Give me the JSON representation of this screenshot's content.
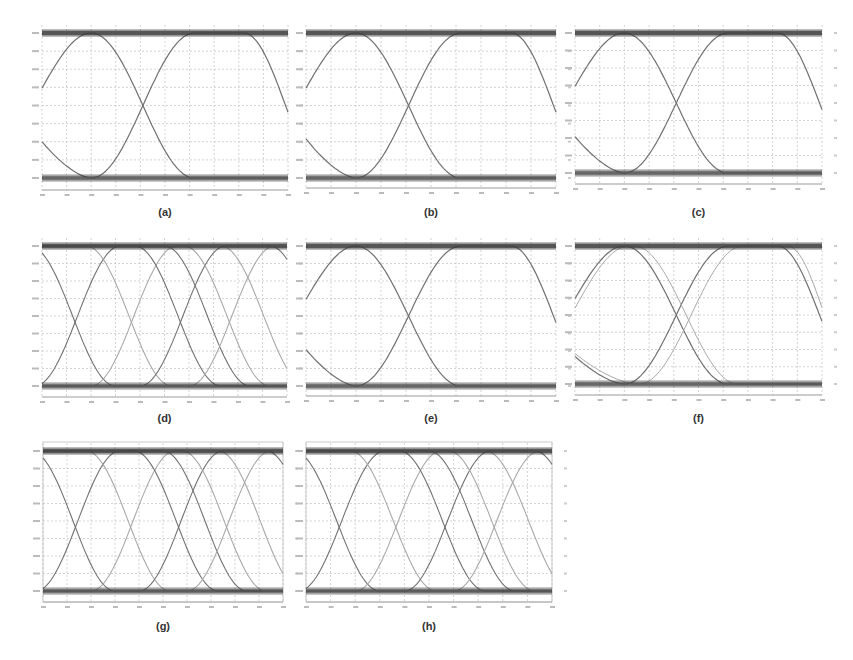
{
  "figure": {
    "panels": [
      {
        "id": "a",
        "label": "(a)",
        "box": [
          42,
          33,
          246,
          145
        ],
        "axis_y": 190,
        "caption_y": 206,
        "type": "eye2",
        "cross_x": 0.41,
        "left_start": 0.25,
        "variant": "plain"
      },
      {
        "id": "b",
        "label": "(b)",
        "box": [
          306,
          33,
          250,
          145
        ],
        "axis_y": 188,
        "caption_y": 206,
        "type": "eye2",
        "cross_x": 0.41,
        "left_start": 0.27,
        "variant": "plain"
      },
      {
        "id": "c",
        "label": "(c)",
        "box": [
          575,
          33,
          247,
          140
        ],
        "axis_y": 184,
        "caption_y": 206,
        "type": "eye2",
        "cross_x": 0.41,
        "left_start": 0.26,
        "variant": "plain"
      },
      {
        "id": "d",
        "label": "(d)",
        "box": [
          42,
          246,
          245,
          140
        ],
        "axis_y": 397,
        "caption_y": 412,
        "type": "eye3",
        "variant": "multi"
      },
      {
        "id": "e",
        "label": "(e)",
        "box": [
          306,
          246,
          250,
          140
        ],
        "axis_y": 396,
        "caption_y": 412,
        "type": "eye2",
        "cross_x": 0.41,
        "left_start": 0.26,
        "variant": "plain"
      },
      {
        "id": "f",
        "label": "(f)",
        "box": [
          575,
          246,
          247,
          138
        ],
        "axis_y": 395,
        "caption_y": 412,
        "type": "eye2",
        "cross_x": 0.37,
        "left_start": 0.2,
        "variant": "double"
      },
      {
        "id": "g",
        "label": "(g)",
        "box": [
          43,
          451,
          240,
          140
        ],
        "axis_y": 602,
        "caption_y": 620,
        "type": "eye3",
        "variant": "multi",
        "frame_top": 440
      },
      {
        "id": "h",
        "label": "(h)",
        "box": [
          306,
          451,
          246,
          140
        ],
        "axis_y": 602,
        "caption_y": 620,
        "type": "eye3",
        "variant": "multi",
        "frame_top": 440
      }
    ],
    "colors": {
      "rail": "#3a3a3a",
      "trace_dark": "#707070",
      "trace_light": "#a8a8a8",
      "grid": "#c8c8c8",
      "axis": "#9a9a9a",
      "caption": "#333333"
    }
  },
  "chart_data": [
    {
      "type": "line",
      "title": "(a)",
      "description": "Eye diagram, 2 bit periods, single crossing near 41% of span",
      "y_levels": [
        "high rail",
        "low rail"
      ],
      "grid": {
        "x_divisions": 10,
        "y_divisions": 8
      },
      "xlabel": "",
      "ylabel": ""
    },
    {
      "type": "line",
      "title": "(b)",
      "description": "Eye diagram, 2 bit periods",
      "grid": {
        "x_divisions": 10,
        "y_divisions": 8
      }
    },
    {
      "type": "line",
      "title": "(c)",
      "description": "Eye diagram, 2 bit periods",
      "grid": {
        "x_divisions": 10,
        "y_divisions": 8
      }
    },
    {
      "type": "line",
      "title": "(d)",
      "description": "Eye diagram, 3 transition sets, multiple overlaid traces",
      "grid": {
        "x_divisions": 10,
        "y_divisions": 8
      }
    },
    {
      "type": "line",
      "title": "(e)",
      "description": "Eye diagram, 2 bit periods",
      "grid": {
        "x_divisions": 10,
        "y_divisions": 8
      }
    },
    {
      "type": "line",
      "title": "(f)",
      "description": "Eye diagram, 2 bit periods with doubled offset traces",
      "grid": {
        "x_divisions": 10,
        "y_divisions": 8
      }
    },
    {
      "type": "line",
      "title": "(g)",
      "description": "Eye diagram, 3 transition sets, framed plot",
      "grid": {
        "x_divisions": 10,
        "y_divisions": 8
      }
    },
    {
      "type": "line",
      "title": "(h)",
      "description": "Eye diagram, 3 transition sets, framed plot",
      "grid": {
        "x_divisions": 10,
        "y_divisions": 8
      }
    }
  ]
}
